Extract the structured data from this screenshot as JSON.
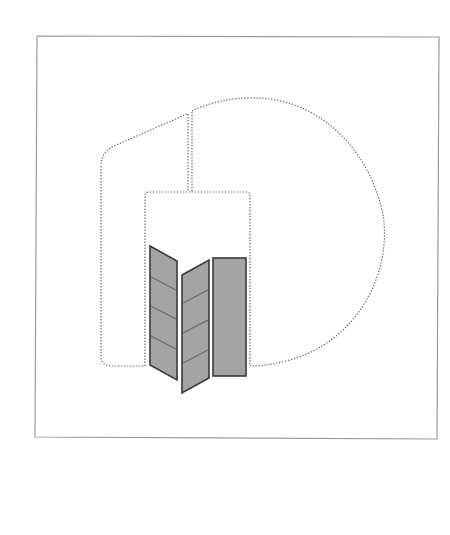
{
  "diagram": {
    "colors": {
      "background": "#ffffff",
      "frame_stroke": "#9a9a9a",
      "dotted_stroke": "#6e6e6e",
      "panel_fill": "#a3a3a3",
      "panel_stroke": "#3a3a3a",
      "panel_line": "#6a6a6a"
    },
    "frame": {
      "x1": 37,
      "y1": 36,
      "x2": 439,
      "y2": 36,
      "x3": 437,
      "y3": 439,
      "x4": 35,
      "y4": 437
    },
    "panels": [
      {
        "name": "left-angled-panel",
        "points": "150,246 177,261 177,380 150,365",
        "lines": [
          [
            150,
            277,
            177,
            290
          ],
          [
            150,
            306,
            177,
            319
          ],
          [
            150,
            336,
            177,
            349
          ]
        ]
      },
      {
        "name": "middle-angled-panel",
        "points": "182,275 209,260 209,378 182,393",
        "lines": [
          [
            182,
            303,
            209,
            290
          ],
          [
            182,
            333,
            209,
            320
          ],
          [
            182,
            363,
            209,
            350
          ]
        ]
      },
      {
        "name": "right-flat-panel",
        "points": "213,257 246,257 246,376 213,376",
        "lines": []
      }
    ]
  }
}
